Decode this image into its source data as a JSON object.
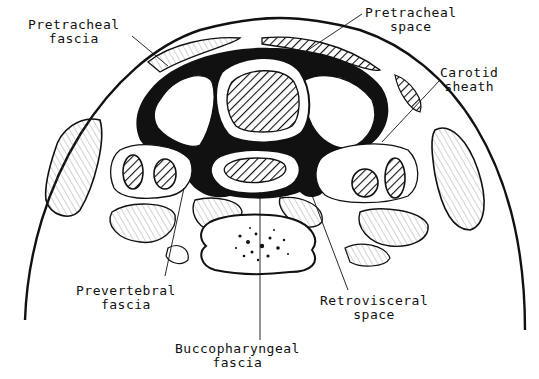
{
  "diagram": {
    "type": "anatomical cross-section",
    "colors": {
      "ink": "#111111",
      "background": "#ffffff"
    },
    "labels": [
      {
        "id": "pretracheal-fascia",
        "line1": "Pretracheal",
        "line2": "fascia"
      },
      {
        "id": "pretracheal-space",
        "line1": "Pretracheal",
        "line2": "space"
      },
      {
        "id": "carotid-sheath",
        "line1": "Carotid",
        "line2": "sheath"
      },
      {
        "id": "prevertebral-fascia",
        "line1": "Prevertebral",
        "line2": "fascia"
      },
      {
        "id": "retrovisceral-space",
        "line1": "Retrovisceral",
        "line2": "space"
      },
      {
        "id": "buccopharyngeal-fascia",
        "line1": "Buccopharyngeal",
        "line2": "fascia"
      }
    ]
  }
}
